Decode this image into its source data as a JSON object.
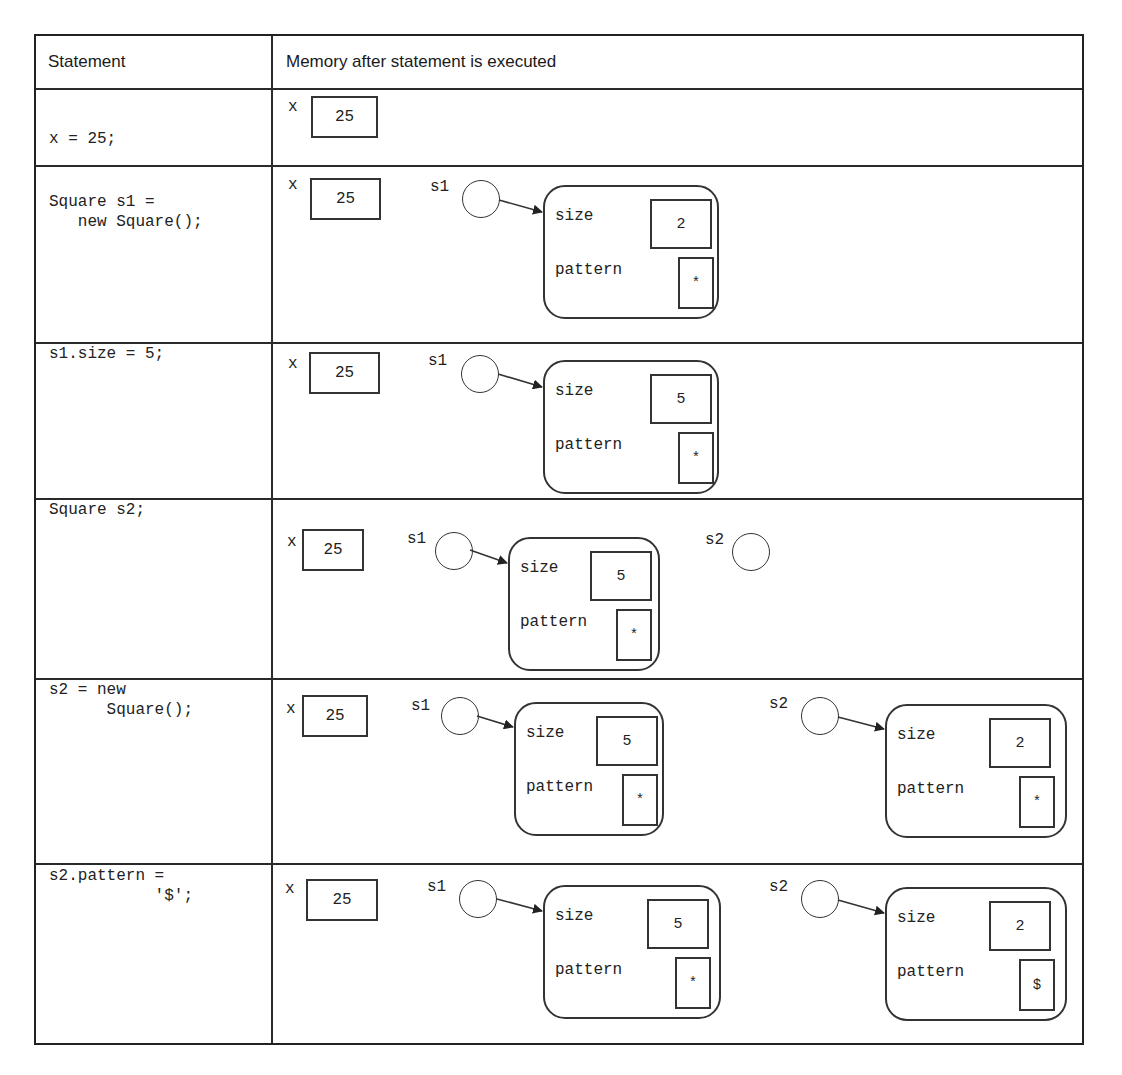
{
  "table": {
    "headers": [
      "Statement",
      "Memory after statement is executed"
    ],
    "rows": [
      {
        "statement": "x = 25;",
        "memory": {
          "x": "25",
          "refs": []
        }
      },
      {
        "statement": "Square s1 =\n   new Square();",
        "memory": {
          "x": "25",
          "refs": [
            {
              "name": "s1",
              "object": {
                "size_label": "size",
                "size": "2",
                "pattern_label": "pattern",
                "pattern": "*"
              }
            }
          ]
        }
      },
      {
        "statement": "s1.size = 5;",
        "memory": {
          "x": "25",
          "refs": [
            {
              "name": "s1",
              "object": {
                "size_label": "size",
                "size": "5",
                "pattern_label": "pattern",
                "pattern": "*"
              }
            }
          ]
        }
      },
      {
        "statement": "Square s2;",
        "memory": {
          "x": "25",
          "refs": [
            {
              "name": "s1",
              "object": {
                "size_label": "size",
                "size": "5",
                "pattern_label": "pattern",
                "pattern": "*"
              }
            },
            {
              "name": "s2",
              "object": null
            }
          ]
        }
      },
      {
        "statement": "s2 = new\n      Square();",
        "memory": {
          "x": "25",
          "refs": [
            {
              "name": "s1",
              "object": {
                "size_label": "size",
                "size": "5",
                "pattern_label": "pattern",
                "pattern": "*"
              }
            },
            {
              "name": "s2",
              "object": {
                "size_label": "size",
                "size": "2",
                "pattern_label": "pattern",
                "pattern": "*"
              }
            }
          ]
        }
      },
      {
        "statement": "s2.pattern =\n           '$';",
        "memory": {
          "x": "25",
          "refs": [
            {
              "name": "s1",
              "object": {
                "size_label": "size",
                "size": "5",
                "pattern_label": "pattern",
                "pattern": "*"
              }
            },
            {
              "name": "s2",
              "object": {
                "size_label": "size",
                "size": "2",
                "pattern_label": "pattern",
                "pattern": "$"
              }
            }
          ]
        }
      }
    ]
  },
  "labels": {
    "x_var": "x"
  }
}
